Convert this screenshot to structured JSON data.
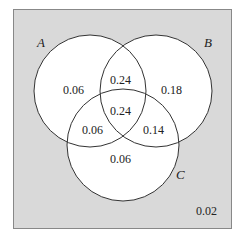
{
  "diagram": {
    "type": "venn",
    "colors": {
      "universe": "#d9d9d9",
      "circle_fill": "#ffffff",
      "stroke": "#333333"
    },
    "sets": [
      {
        "name": "A",
        "label": "A"
      },
      {
        "name": "B",
        "label": "B"
      },
      {
        "name": "C",
        "label": "C"
      }
    ],
    "regions": {
      "A_only": "0.06",
      "B_only": "0.18",
      "C_only": "0.06",
      "AB_only": "0.24",
      "AC_only": "0.06",
      "BC_only": "0.14",
      "ABC": "0.24",
      "outside": "0.02"
    }
  }
}
